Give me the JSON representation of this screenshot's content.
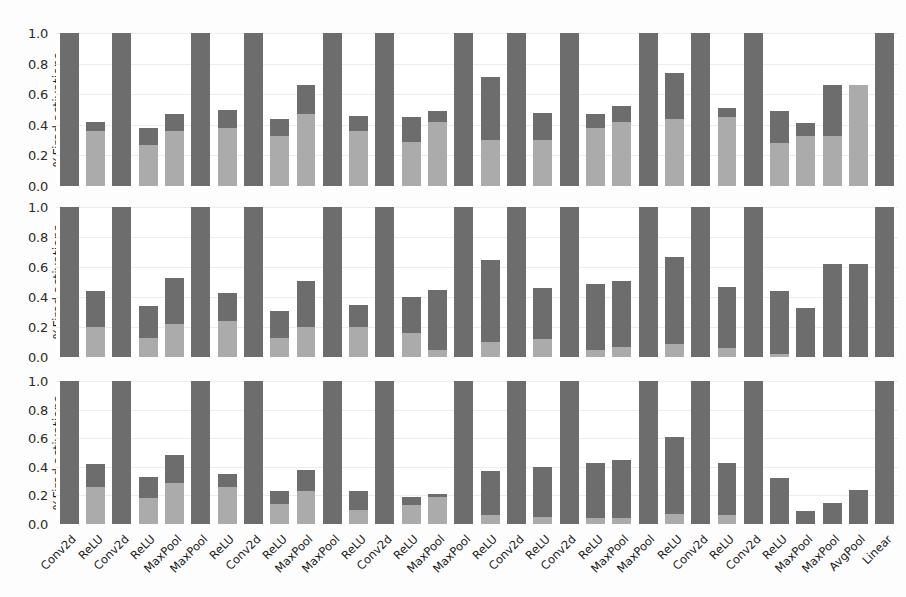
{
  "figure": {
    "background": "#ffffff",
    "colors": {
      "segment_top": "#6d6d6d",
      "segment_bottom": "#ababab",
      "grid": "#ececec",
      "text": "#1a1a1a"
    }
  },
  "chart_data": {
    "type": "bar",
    "subtype": "stacked-bar",
    "title": "",
    "xlabel": "",
    "ylabel": "%Fired activations",
    "ylim": [
      0.0,
      1.0
    ],
    "yticks": [
      "0.0",
      "0.2",
      "0.4",
      "0.6",
      "0.8",
      "1.0"
    ],
    "ytick_values": [
      0.0,
      0.2,
      0.4,
      0.6,
      0.8,
      1.0
    ],
    "grid": true,
    "legend": null,
    "n_panels": 3,
    "panel_labels": [
      "%Fired activations",
      "%Fired activations",
      "%Fired activations"
    ],
    "categories": [
      "Conv2d",
      "ReLU",
      "Conv2d",
      "ReLU",
      "MaxPool",
      "MaxPool",
      "ReLU",
      "Conv2d",
      "ReLU",
      "MaxPool",
      "MaxPool",
      "ReLU",
      "Conv2d",
      "ReLU",
      "MaxPool",
      "MaxPool",
      "ReLU",
      "Conv2d",
      "ReLU",
      "Conv2d",
      "ReLU",
      "MaxPool",
      "MaxPool",
      "ReLU",
      "Conv2d",
      "ReLU",
      "Conv2d",
      "ReLU",
      "MaxPool",
      "MaxPool",
      "AvgPool",
      "Linear"
    ],
    "panels": [
      {
        "name": "panel-top",
        "series": [
          {
            "name": "lower-segment",
            "values": [
              1.0,
              0.36,
              1.0,
              0.27,
              0.36,
              1.0,
              0.38,
              1.0,
              0.33,
              0.47,
              1.0,
              0.36,
              1.0,
              0.29,
              0.42,
              1.0,
              0.3,
              1.0,
              0.3,
              1.0,
              0.38,
              0.42,
              1.0,
              0.44,
              1.0,
              0.45,
              1.0,
              0.28,
              0.33,
              0.33,
              1.0,
              1.0
            ]
          },
          {
            "name": "upper-segment",
            "values": [
              1.0,
              0.42,
              1.0,
              0.38,
              0.47,
              1.0,
              0.5,
              1.0,
              0.44,
              0.66,
              1.0,
              0.46,
              1.0,
              0.45,
              0.49,
              1.0,
              0.71,
              1.0,
              0.48,
              1.0,
              0.47,
              0.52,
              1.0,
              0.74,
              1.0,
              0.51,
              1.0,
              0.49,
              0.41,
              0.66,
              0.66,
              1.0
            ]
          }
        ]
      },
      {
        "name": "panel-middle",
        "series": [
          {
            "name": "lower-segment",
            "values": [
              1.0,
              0.2,
              1.0,
              0.13,
              0.22,
              1.0,
              0.24,
              1.0,
              0.13,
              0.2,
              1.0,
              0.2,
              1.0,
              0.16,
              0.05,
              1.0,
              0.1,
              1.0,
              0.12,
              1.0,
              0.05,
              0.07,
              1.0,
              0.09,
              1.0,
              0.06,
              1.0,
              0.02,
              0.0,
              0.0,
              0.0,
              1.0
            ]
          },
          {
            "name": "upper-segment",
            "values": [
              1.0,
              0.44,
              1.0,
              0.34,
              0.53,
              1.0,
              0.43,
              1.0,
              0.31,
              0.51,
              1.0,
              0.35,
              1.0,
              0.4,
              0.45,
              1.0,
              0.65,
              1.0,
              0.46,
              1.0,
              0.49,
              0.51,
              1.0,
              0.67,
              1.0,
              0.47,
              1.0,
              0.44,
              0.33,
              0.62,
              0.62,
              1.0
            ]
          }
        ]
      },
      {
        "name": "panel-bottom",
        "series": [
          {
            "name": "lower-segment",
            "values": [
              1.0,
              0.26,
              1.0,
              0.18,
              0.29,
              1.0,
              0.26,
              1.0,
              0.14,
              0.23,
              1.0,
              0.1,
              1.0,
              0.13,
              0.19,
              1.0,
              0.06,
              1.0,
              0.05,
              1.0,
              0.04,
              0.04,
              1.0,
              0.07,
              1.0,
              0.06,
              1.0,
              0.0,
              0.0,
              0.0,
              0.0,
              1.0
            ]
          },
          {
            "name": "upper-segment",
            "values": [
              1.0,
              0.42,
              1.0,
              0.33,
              0.48,
              1.0,
              0.35,
              1.0,
              0.23,
              0.38,
              1.0,
              0.23,
              1.0,
              0.19,
              0.21,
              1.0,
              0.37,
              1.0,
              0.4,
              1.0,
              0.43,
              0.45,
              1.0,
              0.61,
              1.0,
              0.43,
              1.0,
              0.32,
              0.09,
              0.15,
              0.24,
              1.0
            ]
          }
        ]
      }
    ]
  }
}
